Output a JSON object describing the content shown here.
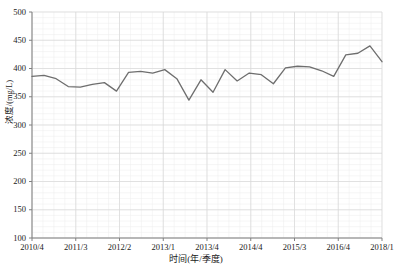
{
  "chart_data": {
    "type": "line",
    "title": "",
    "xlabel": "时间(年/季度)",
    "ylabel": "浓度/(mg/L)",
    "ylim": [
      100,
      500
    ],
    "yticks": [
      100,
      150,
      200,
      250,
      300,
      350,
      400,
      450,
      500
    ],
    "ytick_labels": [
      "100",
      "150",
      "200",
      "250",
      "300",
      "350",
      "400",
      "450",
      "500"
    ],
    "xtick_labels": [
      "2010/4",
      "2011/3",
      "2012/2",
      "2013/1",
      "2013/4",
      "2014/4",
      "2015/3",
      "2016/4",
      "2018/1"
    ],
    "grid": true,
    "grid_minor": true,
    "legend": "none",
    "line_color": "#6e6e6e",
    "grid_color": "#d9d9d9",
    "minor_grid_color": "#ededed",
    "axis_color": "#808080",
    "series": [
      {
        "name": "浓度",
        "x": [
          "2010/4",
          "2011/1",
          "2011/2",
          "2011/3",
          "2011/4",
          "2012/1",
          "2012/2",
          "2012/3",
          "2012/4",
          "2013/1",
          "2013/2",
          "2013/3",
          "2013/4",
          "2014/1",
          "2014/2",
          "2014/3",
          "2014/4",
          "2015/1",
          "2015/2",
          "2015/3",
          "2015/4",
          "2016/1",
          "2016/2",
          "2016/3",
          "2016/4",
          "2017/1",
          "2017/2",
          "2017/3",
          "2017/4",
          "2018/1"
        ],
        "values": [
          386,
          388,
          382,
          368,
          367,
          372,
          375,
          360,
          393,
          395,
          392,
          398,
          382,
          344,
          380,
          358,
          398,
          378,
          392,
          389,
          373,
          401,
          404,
          403,
          396,
          386,
          424,
          427,
          440,
          412
        ]
      }
    ]
  }
}
